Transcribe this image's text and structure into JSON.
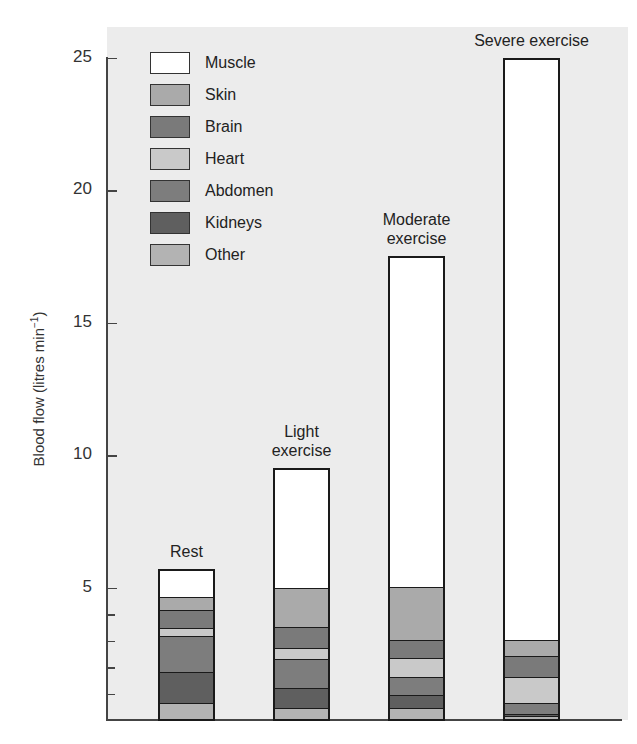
{
  "chart_data": {
    "type": "bar",
    "stacked": true,
    "title": "",
    "xlabel": "",
    "ylabel": "Blood flow (litres min⁻¹)",
    "ylabel_base": "Blood flow (litres min",
    "ylabel_sup": "−1",
    "ylabel_close": ")",
    "ylim": [
      0,
      25
    ],
    "yticks_major": [
      5,
      10,
      15,
      20,
      25
    ],
    "yticks_minor": [
      1,
      2,
      3,
      4
    ],
    "grid": false,
    "legend_position": "upper-left",
    "categories": [
      "Rest",
      "Light exercise",
      "Moderate exercise",
      "Severe exercise"
    ],
    "category_labels": [
      [
        "Rest"
      ],
      [
        "Light",
        "exercise"
      ],
      [
        "Moderate",
        "exercise"
      ],
      [
        "Severe exercise"
      ]
    ],
    "series": [
      {
        "name": "Other",
        "color": "#b3b3b3",
        "values": [
          0.6,
          0.4,
          0.4,
          0.1
        ]
      },
      {
        "name": "Kidneys",
        "color": "#5f5f5f",
        "values": [
          1.2,
          0.8,
          0.5,
          0.1
        ]
      },
      {
        "name": "Abdomen",
        "color": "#7d7d7d",
        "values": [
          1.4,
          1.1,
          0.7,
          0.4
        ]
      },
      {
        "name": "Heart",
        "color": "#c9c9c9",
        "values": [
          0.3,
          0.4,
          0.7,
          1.0
        ]
      },
      {
        "name": "Brain",
        "color": "#7a7a7a",
        "values": [
          0.7,
          0.8,
          0.7,
          0.8
        ]
      },
      {
        "name": "Skin",
        "color": "#aaaaaa",
        "values": [
          0.5,
          1.5,
          2.0,
          0.6
        ]
      },
      {
        "name": "Muscle",
        "color": "#ffffff",
        "values": [
          1.0,
          4.5,
          12.5,
          22.0
        ]
      }
    ],
    "totals": [
      5.7,
      9.5,
      17.5,
      25.0
    ]
  },
  "legend": [
    {
      "label": "Muscle",
      "color": "#ffffff"
    },
    {
      "label": "Skin",
      "color": "#aaaaaa"
    },
    {
      "label": "Brain",
      "color": "#7a7a7a"
    },
    {
      "label": "Heart",
      "color": "#c9c9c9"
    },
    {
      "label": "Abdomen",
      "color": "#7d7d7d"
    },
    {
      "label": "Kidneys",
      "color": "#5f5f5f"
    },
    {
      "label": "Other",
      "color": "#b3b3b3"
    }
  ]
}
